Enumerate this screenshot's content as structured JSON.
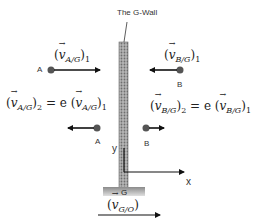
{
  "title": "The G-Wall",
  "balls": {
    "a_top": {
      "label": "A",
      "velocity_label": {
        "open": "(",
        "v": "v",
        "sub": "A/G",
        "close": ")",
        "index": "1"
      }
    },
    "b_top": {
      "label": "B",
      "velocity_label": {
        "open": "(",
        "v": "v",
        "sub": "B/G",
        "close": ")",
        "index": "1"
      }
    },
    "a_bottom": {
      "label": "A"
    },
    "b_bottom": {
      "label": "B"
    }
  },
  "equations": {
    "left": {
      "lhs_sub": "A/G",
      "lhs_index": "2",
      "eq": " = e (",
      "rhs_sub": "A/G",
      "rhs_index": "1"
    },
    "right": {
      "lhs_sub": "B/G",
      "lhs_index": "2",
      "eq": " = e (",
      "rhs_sub": "B/G",
      "rhs_index": "1"
    }
  },
  "wall": {
    "base_label": "G"
  },
  "axes": {
    "x_label": "x",
    "y_label": "y"
  },
  "ground_velocity": {
    "v": "v",
    "sub": "G/O"
  },
  "colors": {
    "ball": "#555555",
    "wall_fill": "#9a9a9a",
    "arrow": "#111111"
  }
}
